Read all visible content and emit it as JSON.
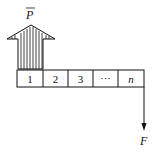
{
  "diagram": {
    "type": "cash-flow-diagram",
    "top_label": "P",
    "top_label_overbar": true,
    "periods": [
      "1",
      "2",
      "3",
      "···",
      "n"
    ],
    "bottom_label": "F",
    "colors": {
      "stroke": "#111111",
      "background": "#ffffff"
    }
  }
}
